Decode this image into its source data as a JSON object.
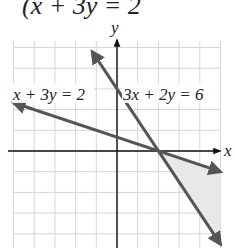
{
  "header": {
    "equation_partial": "(x + 3y = 2"
  },
  "chart_data": {
    "type": "line",
    "title": "",
    "xlabel": "x",
    "ylabel": "y",
    "xlim": [
      -5,
      5
    ],
    "ylim": [
      -5,
      5
    ],
    "grid": true,
    "grid_step": 1,
    "series": [
      {
        "name": "x + 3y = 2",
        "label": "x + 3y = 2",
        "equation": {
          "a": 1,
          "b": 3,
          "c": 2
        },
        "points": [
          [
            -5,
            2.33
          ],
          [
            5,
            -1
          ]
        ],
        "color": "#555555"
      },
      {
        "name": "3x + 2y = 6",
        "label": "3x + 2y = 6",
        "equation": {
          "a": 3,
          "b": 2,
          "c": 6
        },
        "points": [
          [
            -1.2,
            4.8
          ],
          [
            5,
            -4.5
          ]
        ],
        "color": "#555555"
      }
    ],
    "intersection": [
      2,
      0
    ],
    "shaded_region": {
      "description": "region between lines to the right of intersection",
      "vertices": [
        [
          2,
          0
        ],
        [
          5,
          -1
        ],
        [
          5,
          -4.5
        ]
      ],
      "color": "#e8e8e8"
    },
    "axis_color": "#111111",
    "grid_color": "#d6d6d6"
  }
}
